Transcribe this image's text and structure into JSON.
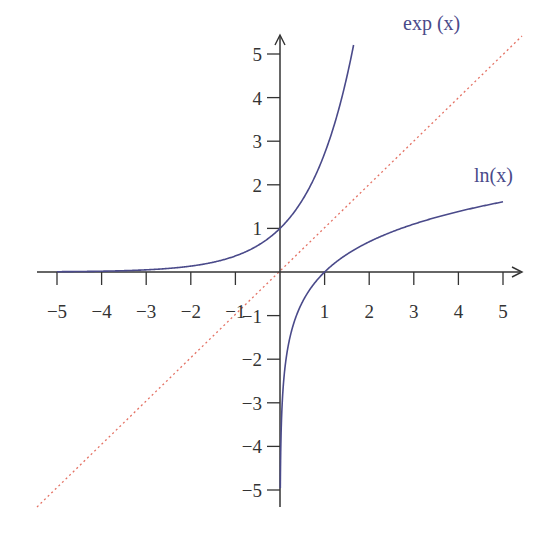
{
  "chart_data": {
    "type": "line",
    "title": "",
    "xlabel": "",
    "ylabel": "",
    "xlim": [
      -5,
      5
    ],
    "ylim": [
      -5,
      5
    ],
    "grid": false,
    "x_ticks": [
      -5,
      -4,
      -3,
      -2,
      -1,
      1,
      2,
      3,
      4,
      5
    ],
    "y_ticks": [
      -5,
      -4,
      -3,
      -2,
      -1,
      1,
      2,
      3,
      4,
      5
    ],
    "x_tick_labels": [
      "−5",
      "−4",
      "−3",
      "−2",
      "−1",
      "1",
      "2",
      "3",
      "4",
      "5"
    ],
    "y_tick_labels": [
      "−5",
      "−4",
      "−3",
      "−2",
      "−1",
      "1",
      "2",
      "3",
      "4",
      "5"
    ],
    "series": [
      {
        "name": "exp(x)",
        "label": "exp (x)",
        "function": "exp",
        "x_range": [
          -5,
          1.65
        ],
        "color": "#4a4a8a",
        "style": "solid"
      },
      {
        "name": "ln(x)",
        "label": "ln(x)",
        "function": "ln",
        "x_range": [
          0.007,
          5
        ],
        "color": "#4a4a8a",
        "style": "solid"
      },
      {
        "name": "y = x",
        "label": "",
        "function": "identity",
        "x_range": [
          -5.5,
          5.5
        ],
        "color": "#e05a4a",
        "style": "dotted"
      }
    ],
    "annotations": [
      {
        "text": "exp (x)",
        "x": 2.3,
        "y": 5.1
      },
      {
        "text": "ln(x)",
        "x": 4.5,
        "y": 1.9
      }
    ]
  },
  "labels": {
    "exp": "exp (x)",
    "ln": "ln(x)"
  }
}
